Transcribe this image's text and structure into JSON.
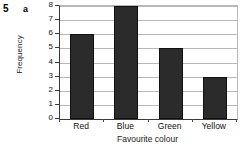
{
  "question": {
    "number": "5",
    "part": "a"
  },
  "chart_data": {
    "type": "bar",
    "title": "",
    "subtitle": "",
    "xlabel": "Favourite colour",
    "ylabel": "Frequency",
    "categories": [
      "Red",
      "Blue",
      "Green",
      "Yellow"
    ],
    "values": [
      6,
      8,
      5,
      3
    ],
    "series": [
      {
        "name": "Frequency",
        "values": [
          6,
          8,
          5,
          3
        ]
      }
    ],
    "ylim": [
      0,
      8
    ],
    "ytick_labels": [
      "0",
      "1",
      "2",
      "3",
      "4",
      "5",
      "6",
      "7",
      "8"
    ],
    "ytick_values": [
      0,
      1,
      2,
      3,
      4,
      5,
      6,
      7,
      8
    ],
    "ytick_step": 1,
    "grid": true,
    "grid_axis": "y",
    "legend": false,
    "legend_position": "none",
    "annotations": [],
    "colors": {
      "bar": "#2b2b2b",
      "gridline": "#b8b8b8",
      "axis": "#3a3a3a",
      "background": "#ffffff",
      "text": "#111111"
    }
  }
}
